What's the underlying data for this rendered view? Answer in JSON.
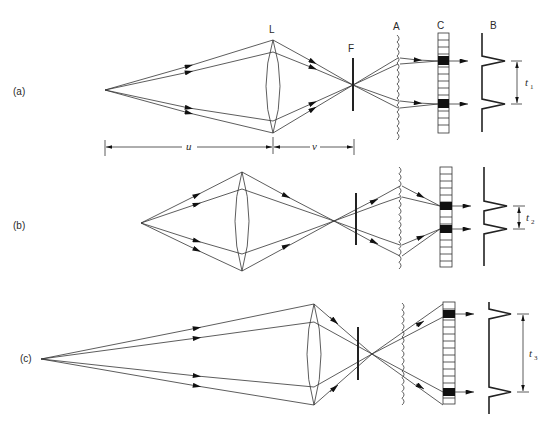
{
  "diagram": {
    "type": "optical ray diagram",
    "component_labels": {
      "lens": "L",
      "film_plane": "F",
      "lenslet_array": "A",
      "detector_array": "C",
      "output_signal": "B"
    },
    "dimension_labels": {
      "object_distance": "u",
      "image_distance": "v"
    },
    "panels": [
      {
        "id": "a",
        "label": "(a)",
        "condition": "in focus — rays converge at F",
        "separation_label": "t",
        "separation_sub": "1"
      },
      {
        "id": "b",
        "label": "(b)",
        "condition": "focus in front of F",
        "separation_label": "t",
        "separation_sub": "2"
      },
      {
        "id": "c",
        "label": "(c)",
        "condition": "focus behind F",
        "separation_label": "t",
        "separation_sub": "3"
      }
    ]
  }
}
